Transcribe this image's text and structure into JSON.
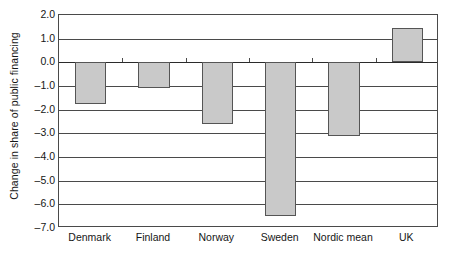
{
  "chart_data": {
    "type": "bar",
    "title": "",
    "xlabel": "",
    "ylabel": "Change in share of public financing",
    "categories": [
      "Denmark",
      "Finland",
      "Norway",
      "Sweden",
      "Nordic mean",
      "UK"
    ],
    "values": [
      -1.75,
      -1.1,
      -2.6,
      -6.5,
      -3.1,
      1.45
    ],
    "ylim": [
      -7.0,
      2.0
    ],
    "ytick_values": [
      2.0,
      1.0,
      0.0,
      -1.0,
      -2.0,
      -3.0,
      -4.0,
      -5.0,
      -6.0,
      -7.0
    ],
    "ytick_labels": [
      "2.0",
      "1.0",
      "0.0",
      "–1.0",
      "–2.0",
      "–3.0",
      "–4.0",
      "–5.0",
      "–6.0",
      "–7.0"
    ],
    "grid": true,
    "legend": null,
    "bar_fill_color": "#c9c9c9",
    "bar_border_color": "#555555",
    "axis_color": "#4a4a4a",
    "background_color": "#ffffff"
  }
}
